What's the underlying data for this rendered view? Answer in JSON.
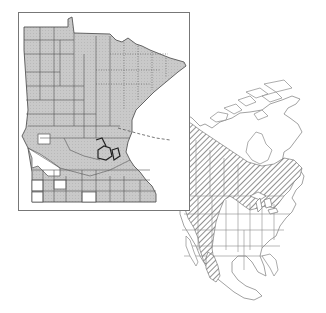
{
  "figure": {
    "type": "species-range-map",
    "panels": [
      {
        "id": "minnesota-inset",
        "region": "Minnesota",
        "subdivision": "counties",
        "shaded_meaning": "county occurrence",
        "unshaded_counties_approx": [
          "far-southwest cluster",
          "west-central single county",
          "south-central border county"
        ],
        "frame": {
          "x": 18,
          "y": 12,
          "width": 172,
          "height": 199
        }
      },
      {
        "id": "north-america-map",
        "region": "North America",
        "range_style": "diagonal hatching",
        "range_extent": [
          "Alaska",
          "boreal Canada",
          "Pacific Northwest",
          "Rocky Mountains",
          "Great Lakes",
          "Northeastern US",
          "Atlantic Canada",
          "Sierra Madre (Mexico)"
        ]
      }
    ],
    "leader_line": {
      "from": "Minnesota inset",
      "to": "Minnesota location on continental map",
      "style": "dashed"
    }
  },
  "colors": {
    "background": "#ffffff",
    "county_fill": "#c8c8c8",
    "county_border": "#555555",
    "frame": "#777777",
    "outline": "#8a8a8a",
    "hatch": "#555555"
  }
}
